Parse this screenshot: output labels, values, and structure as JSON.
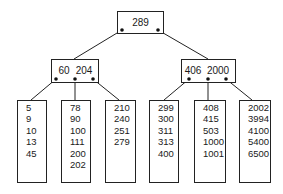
{
  "diagram": {
    "type": "B-tree",
    "root": {
      "keys": [
        "289"
      ]
    },
    "internal_nodes": [
      {
        "keys": [
          "60",
          "204"
        ]
      },
      {
        "keys": [
          "406",
          "2000"
        ]
      }
    ],
    "leaves": [
      {
        "keys": [
          "5",
          "9",
          "10",
          "13",
          "45"
        ]
      },
      {
        "keys": [
          "78",
          "90",
          "100",
          "111",
          "200",
          "202"
        ]
      },
      {
        "keys": [
          "210",
          "240",
          "251",
          "279"
        ]
      },
      {
        "keys": [
          "299",
          "300",
          "311",
          "313",
          "400"
        ]
      },
      {
        "keys": [
          "408",
          "415",
          "503",
          "1000",
          "1001"
        ]
      },
      {
        "keys": [
          "2002",
          "3994",
          "4100",
          "5400",
          "6500"
        ]
      }
    ],
    "colors": {
      "line": "#222222",
      "text": "#1a1a1a",
      "background": "#ffffff"
    }
  }
}
